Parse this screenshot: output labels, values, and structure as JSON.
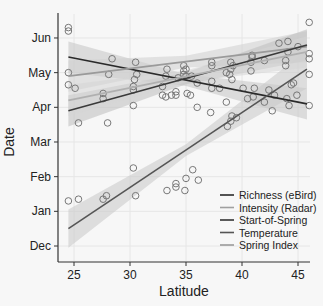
{
  "chart_data": {
    "type": "scatter",
    "title": "",
    "xlabel": "Latitude",
    "ylabel": "Date",
    "xlim": [
      24,
      46.5
    ],
    "ylim": [
      "Nov 25",
      "Jun 25"
    ],
    "x_ticks": [
      25,
      30,
      35,
      40,
      45
    ],
    "y_ticks": [
      "Dec",
      "Jan",
      "Feb",
      "Mar",
      "Apr",
      "May",
      "Jun"
    ],
    "grid": true,
    "legend_position": "lower right",
    "series": [
      {
        "name": "Richness (eBird)",
        "color": "#2a2a2a",
        "fit": {
          "x": [
            24.5,
            45.8
          ],
          "y_month": [
            5.45,
            4.1
          ]
        }
      },
      {
        "name": "Intensity (Radar)",
        "color": "#9a9a9a",
        "fit": {
          "x": [
            24.5,
            45.8
          ],
          "y_month": [
            4.9,
            5.75
          ]
        }
      },
      {
        "name": "Start-of-Spring",
        "color": "#3a3a3a",
        "fit": {
          "x": [
            24.5,
            45.8
          ],
          "y_month": [
            3.9,
            5.8
          ]
        }
      },
      {
        "name": "Temperature",
        "color": "#555555",
        "fit": {
          "x": [
            24.5,
            45.8
          ],
          "y_month": [
            0.5,
            5.1
          ]
        }
      },
      {
        "name": "Spring Index",
        "color": "#b0b0b0",
        "fit": {
          "x": [
            24.5,
            45.8
          ],
          "y_month": [
            4.2,
            5.6
          ]
        }
      }
    ],
    "points": [
      [
        24.5,
        6.3
      ],
      [
        24.5,
        6.2
      ],
      [
        24.5,
        5.0
      ],
      [
        24.5,
        4.65
      ],
      [
        25.1,
        4.55
      ],
      [
        25.4,
        3.55
      ],
      [
        24.5,
        1.3
      ],
      [
        25.4,
        1.35
      ],
      [
        27.6,
        1.35
      ],
      [
        27.9,
        1.45
      ],
      [
        30.3,
        2.25
      ],
      [
        30.5,
        1.45
      ],
      [
        28.0,
        3.55
      ],
      [
        27.6,
        4.25
      ],
      [
        27.6,
        4.4
      ],
      [
        28.1,
        4.95
      ],
      [
        28.4,
        5.4
      ],
      [
        30.3,
        4.5
      ],
      [
        30.3,
        4.6
      ],
      [
        30.4,
        4.8
      ],
      [
        30.6,
        4.95
      ],
      [
        30.5,
        5.3
      ],
      [
        30.3,
        4.05
      ],
      [
        32.9,
        4.35
      ],
      [
        32.9,
        4.6
      ],
      [
        33.2,
        4.3
      ],
      [
        33.2,
        4.9
      ],
      [
        33.3,
        5.1
      ],
      [
        33.7,
        4.35
      ],
      [
        34.1,
        4.35
      ],
      [
        34.1,
        4.45
      ],
      [
        34.3,
        4.85
      ],
      [
        34.8,
        4.95
      ],
      [
        34.8,
        5.2
      ],
      [
        34.8,
        5.05
      ],
      [
        35.0,
        5.1
      ],
      [
        35.0,
        4.9
      ],
      [
        35.1,
        4.4
      ],
      [
        35.4,
        4.35
      ],
      [
        35.5,
        4.9
      ],
      [
        36.0,
        4.7
      ],
      [
        36.0,
        4.0
      ],
      [
        33.3,
        1.6
      ],
      [
        34.1,
        1.7
      ],
      [
        34.1,
        1.8
      ],
      [
        34.9,
        1.6
      ],
      [
        35.0,
        1.95
      ],
      [
        35.6,
        2.2
      ],
      [
        36.1,
        1.9
      ],
      [
        37.3,
        5.3
      ],
      [
        37.3,
        5.2
      ],
      [
        37.3,
        4.75
      ],
      [
        37.3,
        4.55
      ],
      [
        37.2,
        3.85
      ],
      [
        38.6,
        4.15
      ],
      [
        38.0,
        4.55
      ],
      [
        38.6,
        5.0
      ],
      [
        38.9,
        4.95
      ],
      [
        39.0,
        5.1
      ],
      [
        39.0,
        5.3
      ],
      [
        39.1,
        4.8
      ],
      [
        39.1,
        3.75
      ],
      [
        38.7,
        3.45
      ],
      [
        39.0,
        3.6
      ],
      [
        39.2,
        5.2
      ],
      [
        39.5,
        3.7
      ],
      [
        40.1,
        4.55
      ],
      [
        40.5,
        4.25
      ],
      [
        40.8,
        5.05
      ],
      [
        40.8,
        5.3
      ],
      [
        40.9,
        5.45
      ],
      [
        40.9,
        5.5
      ],
      [
        41.0,
        4.3
      ],
      [
        41.1,
        4.55
      ],
      [
        42.0,
        5.35
      ],
      [
        42.0,
        4.15
      ],
      [
        42.4,
        4.5
      ],
      [
        42.7,
        3.9
      ],
      [
        42.9,
        4.35
      ],
      [
        43.3,
        5.85
      ],
      [
        43.9,
        5.35
      ],
      [
        43.9,
        5.2
      ],
      [
        44.1,
        5.9
      ],
      [
        44.1,
        5.6
      ],
      [
        44.0,
        4.25
      ],
      [
        44.2,
        4.05
      ],
      [
        44.4,
        4.65
      ],
      [
        44.6,
        4.7
      ],
      [
        44.9,
        4.35
      ],
      [
        45.0,
        5.75
      ],
      [
        46.0,
        6.45
      ],
      [
        46.0,
        5.55
      ],
      [
        46.0,
        5.4
      ],
      [
        46.0,
        4.95
      ],
      [
        46.0,
        4.05
      ]
    ],
    "legend": [
      "Richness (eBird)",
      "Intensity (Radar)",
      "Start-of-Spring",
      "Temperature",
      "Spring Index"
    ]
  },
  "axes": {
    "xlabel": "Latitude",
    "ylabel": "Date",
    "x_ticks": [
      "25",
      "30",
      "35",
      "40",
      "45"
    ],
    "y_ticks": [
      "Jun",
      "May",
      "Apr",
      "Mar",
      "Feb",
      "Jan",
      "Dec"
    ]
  },
  "legend": {
    "items": [
      {
        "label": "Richness (eBird)",
        "color": "#2a2a2a"
      },
      {
        "label": "Intensity (Radar)",
        "color": "#a0a0a0"
      },
      {
        "label": "Start-of-Spring",
        "color": "#333333"
      },
      {
        "label": "Temperature",
        "color": "#555555"
      },
      {
        "label": "Spring Index",
        "color": "#9a9a9a"
      }
    ]
  }
}
